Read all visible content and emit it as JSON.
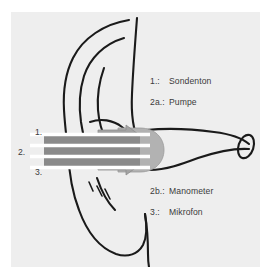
{
  "figure": {
    "panel_background": "#eeeeee",
    "page_background": "#ffffff",
    "ink_color": "#1a1a1a",
    "text_color": "#3b3b3b",
    "tube_dark_gray": "#8a8a8a",
    "tube_mid_gray": "#a8a8a8",
    "probe_tip_gray": "#b0b0b0",
    "arrow_gray": "#a0a0a0"
  },
  "callouts": [
    {
      "id": "callout-1",
      "label": "1."
    },
    {
      "id": "callout-2",
      "label": "2."
    },
    {
      "id": "callout-3",
      "label": "3."
    }
  ],
  "legend_top": [
    {
      "key": "1.:",
      "text": "Sondenton"
    },
    {
      "key": "2a.:",
      "text": "Pumpe"
    }
  ],
  "legend_bottom": [
    {
      "key": "2b.:",
      "text": "Manometer"
    },
    {
      "key": "3.:",
      "text": "Mikrofon"
    }
  ]
}
